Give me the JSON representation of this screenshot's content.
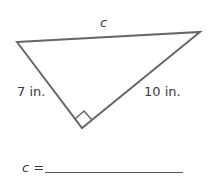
{
  "diagram": {
    "type": "right-triangle",
    "vertices": {
      "top_left": [
        17,
        42
      ],
      "top_right": [
        200,
        32
      ],
      "right_angle": [
        82,
        128
      ]
    },
    "labels": {
      "hypotenuse": "c",
      "left_leg": "7 in.",
      "right_leg": "10 in."
    },
    "right_angle_marker": true,
    "stroke_color": "#666666"
  },
  "answer": {
    "prompt": "c =",
    "value": ""
  }
}
